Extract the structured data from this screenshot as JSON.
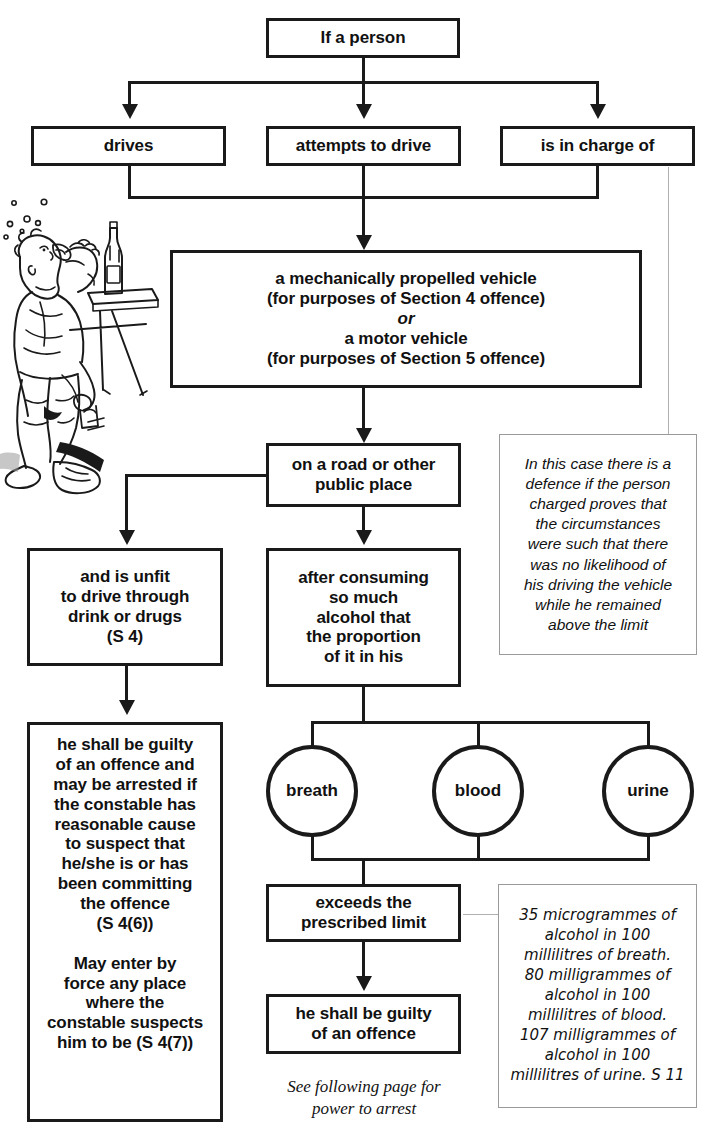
{
  "diagram": {
    "nodes": {
      "if_person": {
        "label": "If a person"
      },
      "drives": {
        "label": "drives"
      },
      "attempts": {
        "label": "attempts to drive"
      },
      "in_charge": {
        "label": "is in charge of"
      },
      "vehicle": {
        "lines": [
          "a mechanically propelled vehicle",
          "(for purposes of Section 4 offence)",
          "or",
          "a motor vehicle",
          "(for purposes of Section 5 offence)"
        ],
        "italic_line_index": 2
      },
      "road": {
        "lines": [
          "on a road or other",
          "public place"
        ]
      },
      "unfit": {
        "lines": [
          "and is unfit",
          "to drive through",
          "drink or drugs",
          "(S 4)"
        ]
      },
      "after_consuming": {
        "lines": [
          "after consuming",
          "so much",
          "alcohol that",
          "the proportion",
          "of it in his"
        ]
      },
      "guilty_s4": {
        "lines": [
          "he shall be guilty",
          "of an offence and",
          "may be arrested if",
          "the constable has",
          "reasonable cause",
          "to suspect that",
          "he/she is or has",
          "been committing",
          "the offence",
          "(S 4(6))",
          "",
          "May enter by",
          "force any place",
          "where the",
          "constable suspects",
          "him to be (S 4(7))"
        ]
      },
      "breath": {
        "label": "breath"
      },
      "blood": {
        "label": "blood"
      },
      "urine": {
        "label": "urine"
      },
      "exceeds": {
        "lines": [
          "exceeds the",
          "prescribed limit"
        ]
      },
      "guilty_s5": {
        "lines": [
          "he shall be guilty",
          "of an offence"
        ]
      }
    },
    "notes": {
      "defence": {
        "lines": [
          "In this case there is a",
          "defence if the person",
          "charged proves that",
          "the circumstances",
          "were such that there",
          "was no likelihood of",
          "his driving the vehicle",
          "while he remained",
          "above the limit"
        ]
      },
      "limits": {
        "lines": [
          "35 microgrammes of",
          "alcohol in 100",
          "millilitres of breath.",
          "80 milligrammes of",
          "alcohol in 100",
          "millilitres of blood.",
          "107 milligrammes of",
          "alcohol in 100",
          "millilitres of urine. S 11"
        ]
      }
    },
    "caption": {
      "lines": [
        "See following page for",
        "power to arrest"
      ]
    },
    "illustration": {
      "name": "drunk-man-drinking-at-bar-cartoon"
    },
    "colors": {
      "line": "#1a1a1a",
      "thin_line": "#b0b0b0",
      "background": "#ffffff",
      "text": "#111111"
    }
  }
}
